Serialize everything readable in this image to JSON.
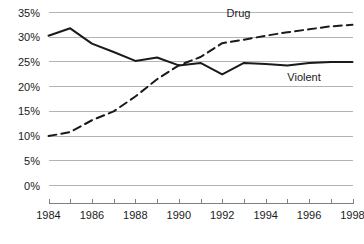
{
  "chart_data": {
    "type": "line",
    "title": "",
    "subtitle": "",
    "xlabel": "",
    "ylabel": "",
    "x": [
      1984,
      1985,
      1986,
      1987,
      1988,
      1989,
      1990,
      1991,
      1992,
      1993,
      1994,
      1995,
      1996,
      1997,
      1998
    ],
    "xlim": [
      1984,
      1998
    ],
    "ylim": [
      0,
      35
    ],
    "grid": true,
    "legend_position": "inline-annotations",
    "y_tick_labels": [
      "0%",
      "5%",
      "10%",
      "15%",
      "20%",
      "25%",
      "30%",
      "35%"
    ],
    "y_tick_values": [
      0,
      5,
      10,
      15,
      20,
      25,
      30,
      35
    ],
    "x_tick_labels": [
      "1984",
      "1986",
      "1988",
      "1990",
      "1992",
      "1994",
      "1996",
      "1998"
    ],
    "x_tick_values": [
      1984,
      1986,
      1988,
      1990,
      1992,
      1994,
      1996,
      1998
    ],
    "x_minor_tick_values": [
      1985,
      1987,
      1989,
      1991,
      1993,
      1995,
      1997
    ],
    "series": [
      {
        "name": "Violent",
        "style": "solid",
        "color": "#1a1a1a",
        "label_text": "Violent",
        "values": [
          30.3,
          31.8,
          28.7,
          27.0,
          25.2,
          25.9,
          24.3,
          24.8,
          22.5,
          24.8,
          24.6,
          24.3,
          24.8,
          25.0,
          25.0
        ]
      },
      {
        "name": "Drug",
        "style": "dashed",
        "color": "#1a1a1a",
        "label_text": "Drug",
        "values": [
          10.0,
          10.8,
          13.2,
          15.0,
          18.0,
          21.5,
          24.3,
          26.0,
          28.8,
          29.5,
          30.3,
          31.0,
          31.6,
          32.2,
          32.5
        ]
      }
    ],
    "annotations": [
      {
        "text": "Drug",
        "x": 1992.2,
        "y": 34.0
      },
      {
        "text": "Violent",
        "x": 1995.0,
        "y": 21.2
      }
    ]
  }
}
